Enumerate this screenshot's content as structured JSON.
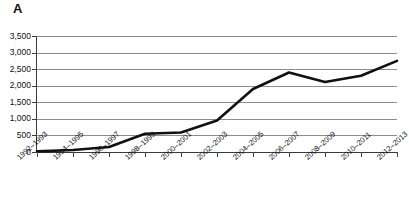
{
  "panel": {
    "label": "A"
  },
  "chart_data": {
    "type": "line",
    "title": "",
    "subtitle": "",
    "xlabel": "",
    "ylabel": "",
    "grid": true,
    "legend": false,
    "legend_position": "none",
    "ylim": [
      0,
      3500
    ],
    "ytick_step": 500,
    "ytick_labels": [
      "0",
      "500",
      "1,000",
      "1,500",
      "2,000",
      "2,500",
      "3,000",
      "3,500"
    ],
    "ytick_values": [
      0,
      500,
      1000,
      1500,
      2000,
      2500,
      3000,
      3500
    ],
    "categories": [
      "1992–1993",
      "1994–1995",
      "1996–1997",
      "1998–1999",
      "2000–2001",
      "2002–2003",
      "2004–2005",
      "2006–2007",
      "2008–2009",
      "2010–2011",
      "2012–2013"
    ],
    "series": [
      {
        "name": "series-1",
        "color": "#111111",
        "values": [
          20,
          60,
          150,
          550,
          590,
          950,
          1900,
          2400,
          2110,
          2300,
          2750
        ]
      }
    ]
  },
  "style": {
    "line_color": "#111111",
    "grid_color": "#8d8d8d",
    "axis_color": "#3a3a3a",
    "background": "#ffffff",
    "text_color": "#111111"
  }
}
